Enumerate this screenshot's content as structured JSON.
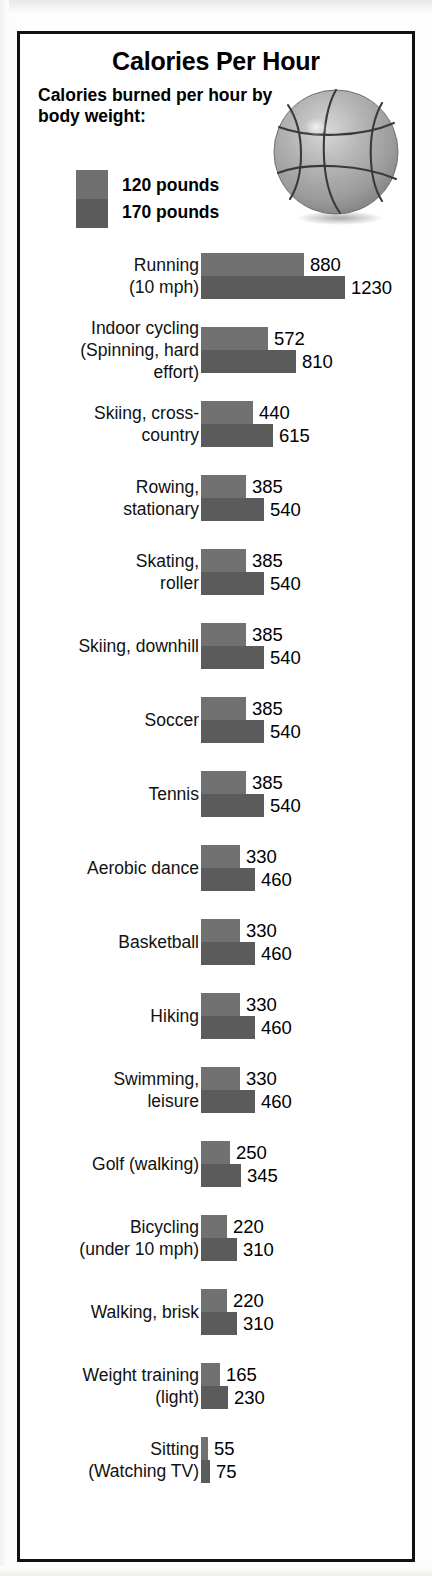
{
  "header": {
    "title": "Calories Per Hour",
    "subtitle": "Calories burned per hour by body weight:",
    "illustration": "basketball-illustration"
  },
  "legend": {
    "series": [
      {
        "label": "120 pounds",
        "color": "#717171"
      },
      {
        "label": "170 pounds",
        "color": "#5b5b5b"
      }
    ]
  },
  "chart_data": {
    "type": "bar",
    "title": "Calories Per Hour",
    "subtitle": "Calories burned per hour by body weight:",
    "xlabel": "",
    "ylabel": "",
    "orientation": "horizontal",
    "grid": false,
    "legend_position": "top-left",
    "xlim": [
      0,
      1230
    ],
    "categories": [
      "Running (10 mph)",
      "Indoor cycling (Spinning, hard effort)",
      "Skiing, cross-country",
      "Rowing, stationary",
      "Skating, roller",
      "Skiing, downhill",
      "Soccer",
      "Tennis",
      "Aerobic dance",
      "Basketball",
      "Hiking",
      "Swimming, leisure",
      "Golf (walking)",
      "Bicycling (under 10 mph)",
      "Walking, brisk",
      "Weight training (light)",
      "Sitting (Watching TV)"
    ],
    "series": [
      {
        "name": "120 pounds",
        "color": "#717171",
        "values": [
          880,
          572,
          440,
          385,
          385,
          385,
          385,
          385,
          330,
          330,
          330,
          330,
          250,
          220,
          220,
          165,
          55
        ]
      },
      {
        "name": "170 pounds",
        "color": "#5b5b5b",
        "values": [
          1230,
          810,
          615,
          540,
          540,
          540,
          540,
          540,
          460,
          460,
          460,
          460,
          345,
          310,
          310,
          230,
          75
        ]
      }
    ]
  },
  "rows": [
    {
      "label_lines": [
        "Running",
        "(10 mph)"
      ],
      "v1": 880,
      "v2": 1230
    },
    {
      "label_lines": [
        "Indoor cycling",
        "(Spinning, hard",
        "effort)"
      ],
      "v1": 572,
      "v2": 810
    },
    {
      "label_lines": [
        "Skiing, cross-",
        "country"
      ],
      "v1": 440,
      "v2": 615
    },
    {
      "label_lines": [
        "Rowing,",
        "stationary"
      ],
      "v1": 385,
      "v2": 540
    },
    {
      "label_lines": [
        "Skating,",
        "roller"
      ],
      "v1": 385,
      "v2": 540
    },
    {
      "label_lines": [
        "Skiing, downhill"
      ],
      "v1": 385,
      "v2": 540
    },
    {
      "label_lines": [
        "Soccer"
      ],
      "v1": 385,
      "v2": 540
    },
    {
      "label_lines": [
        "Tennis"
      ],
      "v1": 385,
      "v2": 540
    },
    {
      "label_lines": [
        "Aerobic dance"
      ],
      "v1": 330,
      "v2": 460
    },
    {
      "label_lines": [
        "Basketball"
      ],
      "v1": 330,
      "v2": 460
    },
    {
      "label_lines": [
        "Hiking"
      ],
      "v1": 330,
      "v2": 460
    },
    {
      "label_lines": [
        "Swimming,",
        "leisure"
      ],
      "v1": 330,
      "v2": 460
    },
    {
      "label_lines": [
        "Golf (walking)"
      ],
      "v1": 250,
      "v2": 345
    },
    {
      "label_lines": [
        "Bicycling",
        "(under 10 mph)"
      ],
      "v1": 220,
      "v2": 310
    },
    {
      "label_lines": [
        "Walking, brisk"
      ],
      "v1": 220,
      "v2": 310
    },
    {
      "label_lines": [
        "Weight training",
        "(light)"
      ],
      "v1": 165,
      "v2": 230
    },
    {
      "label_lines": [
        "Sitting",
        "(Watching TV)"
      ],
      "v1": 55,
      "v2": 75
    }
  ]
}
